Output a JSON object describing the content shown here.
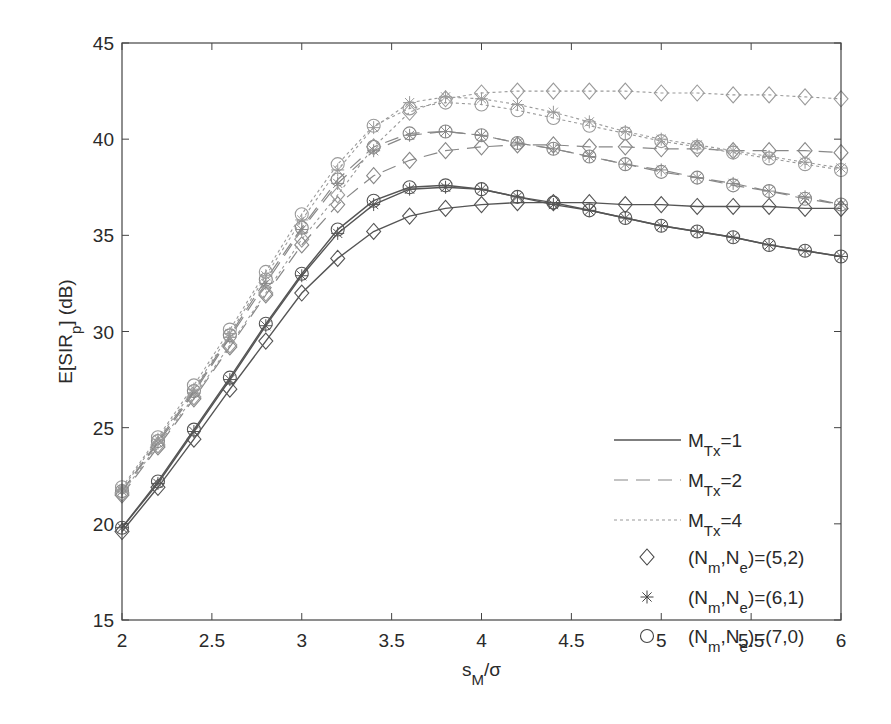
{
  "chart_data": {
    "type": "line",
    "title": "",
    "xlabel": "s_M/σ",
    "xlabel_main": "s",
    "xlabel_sub": "M",
    "xlabel_tail": "/σ",
    "ylabel": "E[SIR_p] (dB)",
    "ylabel_main": "E[SIR",
    "ylabel_sub": "p",
    "ylabel_tail": "] (dB)",
    "xlim": [
      2,
      6
    ],
    "ylim": [
      15,
      45
    ],
    "grid": false,
    "legend_position": "lower right (inside)",
    "x_ticks": [
      2,
      2.5,
      3,
      3.5,
      4,
      4.5,
      5,
      5.5,
      6
    ],
    "x_tick_labels": [
      "2",
      "2.5",
      "3",
      "3.5",
      "4",
      "4.5",
      "5",
      "5.5",
      "6"
    ],
    "y_ticks": [
      15,
      20,
      25,
      30,
      35,
      40,
      45
    ],
    "y_tick_labels": [
      "15",
      "20",
      "25",
      "30",
      "35",
      "40",
      "45"
    ],
    "x": [
      2.0,
      2.2,
      2.4,
      2.6,
      2.8,
      3.0,
      3.2,
      3.4,
      3.6,
      3.8,
      4.0,
      4.2,
      4.4,
      4.6,
      4.8,
      5.0,
      5.2,
      5.4,
      5.6,
      5.8,
      6.0
    ],
    "series": [
      {
        "name": "M_Tx=1, (N_m,N_e)=(5,2)",
        "mtx": 1,
        "marker": "diamond",
        "values": [
          19.6,
          21.9,
          24.4,
          27.0,
          29.5,
          32.0,
          33.8,
          35.2,
          36.0,
          36.4,
          36.6,
          36.7,
          36.7,
          36.7,
          36.6,
          36.6,
          36.5,
          36.5,
          36.5,
          36.4,
          36.4
        ]
      },
      {
        "name": "M_Tx=1, (N_m,N_e)=(6,1)",
        "mtx": 1,
        "marker": "star",
        "values": [
          19.8,
          22.1,
          24.8,
          27.5,
          30.3,
          32.9,
          35.1,
          36.6,
          37.4,
          37.5,
          37.4,
          37.0,
          36.6,
          36.3,
          35.9,
          35.5,
          35.2,
          34.9,
          34.5,
          34.2,
          33.9
        ]
      },
      {
        "name": "M_Tx=1, (N_m,N_e)=(7,0)",
        "mtx": 1,
        "marker": "circle",
        "values": [
          19.8,
          22.2,
          24.9,
          27.6,
          30.4,
          33.0,
          35.3,
          36.8,
          37.5,
          37.6,
          37.4,
          37.0,
          36.7,
          36.3,
          35.9,
          35.5,
          35.2,
          34.9,
          34.5,
          34.2,
          33.9
        ]
      },
      {
        "name": "M_Tx=2, (N_m,N_e)=(5,2)",
        "mtx": 2,
        "marker": "diamond",
        "values": [
          21.5,
          24.0,
          26.5,
          29.2,
          31.9,
          34.5,
          36.6,
          38.1,
          38.9,
          39.4,
          39.6,
          39.7,
          39.7,
          39.6,
          39.6,
          39.5,
          39.5,
          39.4,
          39.4,
          39.4,
          39.3
        ]
      },
      {
        "name": "M_Tx=2, (N_m,N_e)=(6,1)",
        "mtx": 2,
        "marker": "star",
        "values": [
          21.7,
          24.2,
          26.8,
          29.7,
          32.5,
          35.3,
          37.7,
          39.4,
          40.2,
          40.4,
          40.2,
          39.8,
          39.5,
          39.1,
          38.7,
          38.4,
          38.0,
          37.7,
          37.3,
          37.0,
          36.6
        ]
      },
      {
        "name": "M_Tx=2, (N_m,N_e)=(7,0)",
        "mtx": 2,
        "marker": "circle",
        "values": [
          21.7,
          24.3,
          26.9,
          29.8,
          32.7,
          35.4,
          37.9,
          39.6,
          40.3,
          40.4,
          40.2,
          39.8,
          39.5,
          39.1,
          38.7,
          38.3,
          38.0,
          37.6,
          37.3,
          36.9,
          36.6
        ]
      },
      {
        "name": "M_Tx=4, (N_m,N_e)=(5,2)",
        "mtx": 4,
        "marker": "diamond",
        "values": [
          21.6,
          24.1,
          26.6,
          29.3,
          32.0,
          34.8,
          37.1,
          39.6,
          41.4,
          42.1,
          42.4,
          42.5,
          42.5,
          42.5,
          42.5,
          42.4,
          42.4,
          42.3,
          42.3,
          42.2,
          42.1
        ]
      },
      {
        "name": "M_Tx=4, (N_m,N_e)=(6,1)",
        "mtx": 4,
        "marker": "star",
        "values": [
          21.8,
          24.4,
          27.0,
          29.9,
          32.9,
          35.8,
          38.4,
          40.6,
          41.9,
          42.2,
          42.1,
          41.8,
          41.4,
          40.9,
          40.4,
          40.0,
          39.7,
          39.4,
          39.1,
          38.8,
          38.5
        ]
      },
      {
        "name": "M_Tx=4, (N_m,N_e)=(7,0)",
        "mtx": 4,
        "marker": "circle",
        "values": [
          21.9,
          24.5,
          27.2,
          30.1,
          33.1,
          36.1,
          38.7,
          40.7,
          41.6,
          41.9,
          41.8,
          41.5,
          41.1,
          40.7,
          40.3,
          39.9,
          39.6,
          39.3,
          39.0,
          38.7,
          38.4
        ]
      }
    ],
    "line_styles": {
      "1": {
        "dash": "",
        "color": "#555555",
        "width": 1.4
      },
      "2": {
        "dash": "14,8",
        "color": "#888888",
        "width": 1.2
      },
      "4": {
        "dash": "3,3",
        "color": "#9a9a9a",
        "width": 1.1
      }
    },
    "legend": [
      {
        "kind": "line",
        "mtx": 1,
        "label_main": "M",
        "label_sub": "Tx",
        "label_tail": "=1"
      },
      {
        "kind": "line",
        "mtx": 2,
        "label_main": "M",
        "label_sub": "Tx",
        "label_tail": "=2"
      },
      {
        "kind": "line",
        "mtx": 4,
        "label_main": "M",
        "label_sub": "Tx",
        "label_tail": "=4"
      },
      {
        "kind": "marker",
        "marker": "diamond",
        "label_pre": "(N",
        "sub1": "m",
        "mid": ",N",
        "sub2": "e",
        "label_tail": ")=(5,2)"
      },
      {
        "kind": "marker",
        "marker": "star",
        "label_pre": "(N",
        "sub1": "m",
        "mid": ",N",
        "sub2": "e",
        "label_tail": ")=(6,1)"
      },
      {
        "kind": "marker",
        "marker": "circle",
        "label_pre": "(N",
        "sub1": "m",
        "mid": ",N",
        "sub2": "e",
        "label_tail": ")=(7,0)"
      }
    ]
  },
  "layout": {
    "plot_left": 122,
    "plot_top": 43,
    "plot_right": 841,
    "plot_bottom": 620
  }
}
